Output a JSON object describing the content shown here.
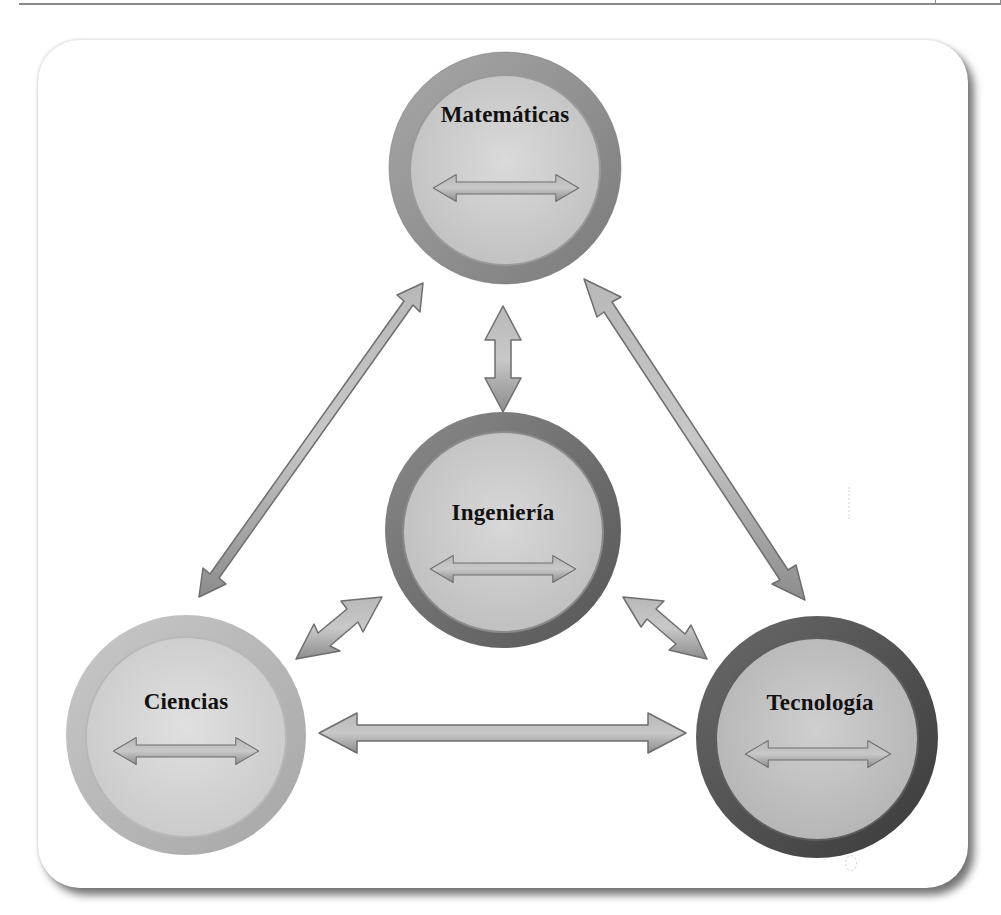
{
  "diagram": {
    "title": "",
    "nodes": [
      {
        "id": "matematicas",
        "label": "Matemáticas",
        "cx": 505,
        "cy": 168,
        "r": 116,
        "ring_color": "#8e8e8e",
        "fill_color": "#cfcfcf"
      },
      {
        "id": "ingenieria",
        "label": "Ingeniería",
        "cx": 503,
        "cy": 530,
        "r": 118,
        "ring_color": "#6f6f6f",
        "fill_color": "#cdcdcd"
      },
      {
        "id": "ciencias",
        "label": "Ciencias",
        "cx": 186,
        "cy": 735,
        "r": 120,
        "ring_color": "#b3b3b3",
        "fill_color": "#d6d6d6"
      },
      {
        "id": "tecnologia",
        "label": "Tecnología",
        "cx": 817,
        "cy": 737,
        "r": 121,
        "ring_color": "#555555",
        "fill_color": "#c4c4c4"
      }
    ],
    "edges": [
      {
        "from": "matematicas",
        "to": "ciencias",
        "type": "bidirectional"
      },
      {
        "from": "matematicas",
        "to": "tecnologia",
        "type": "bidirectional"
      },
      {
        "from": "matematicas",
        "to": "ingenieria",
        "type": "bidirectional"
      },
      {
        "from": "ingenieria",
        "to": "ciencias",
        "type": "bidirectional"
      },
      {
        "from": "ingenieria",
        "to": "tecnologia",
        "type": "bidirectional"
      },
      {
        "from": "ciencias",
        "to": "tecnologia",
        "type": "bidirectional"
      }
    ],
    "arrow_color": "#9a9a9a",
    "arrow_outline": "#6e6e6e"
  }
}
